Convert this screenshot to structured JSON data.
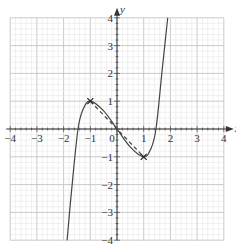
{
  "chart_data": {
    "type": "line",
    "title": "",
    "xlabel": "x",
    "ylabel": "y",
    "xlim": [
      -4,
      4
    ],
    "ylim": [
      -4,
      4
    ],
    "grid": true,
    "x_ticks": [
      "-4",
      "-3",
      "-2",
      "-1",
      "0",
      "1",
      "2",
      "3",
      "4"
    ],
    "y_ticks": [
      "-4",
      "-3",
      "-2",
      "-1",
      "1",
      "2",
      "3",
      "4"
    ],
    "origin_label": "0",
    "series": [
      {
        "name": "cubic curve",
        "style": "solid",
        "points": [
          [
            -1.87,
            -4
          ],
          [
            -1.7,
            -2.2
          ],
          [
            -1.46,
            0
          ],
          [
            -1.25,
            0.75
          ],
          [
            -1,
            1
          ],
          [
            -0.5,
            0.65
          ],
          [
            0,
            0
          ],
          [
            0.5,
            -0.65
          ],
          [
            1,
            -1
          ],
          [
            1.25,
            -0.75
          ],
          [
            1.46,
            0
          ],
          [
            1.7,
            2.2
          ],
          [
            1.9,
            4
          ]
        ]
      },
      {
        "name": "secant line",
        "style": "dashed",
        "points": [
          [
            -1,
            1
          ],
          [
            1,
            -1
          ]
        ]
      }
    ],
    "marked_points": [
      {
        "x": -1,
        "y": 1,
        "marker": "cross"
      },
      {
        "x": 1,
        "y": -1,
        "marker": "cross"
      }
    ]
  }
}
